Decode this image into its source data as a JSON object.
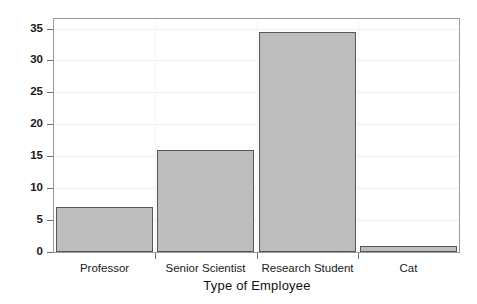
{
  "chart_data": {
    "type": "bar",
    "title": "",
    "xlabel": "Type of Employee",
    "ylabel": "Frequency",
    "categories": [
      "Professor",
      "Senior Scientist",
      "Research Student",
      "Cat"
    ],
    "values": [
      7,
      16,
      34.5,
      1
    ],
    "series": [
      {
        "name": "Frequency",
        "values": [
          7,
          16,
          34.5,
          1
        ]
      }
    ],
    "ylim": [
      0,
      36.5
    ],
    "yticks": [
      0,
      5,
      10,
      15,
      20,
      25,
      30,
      35
    ],
    "ytick_labels": [
      "0",
      "5",
      "10",
      "15",
      "20",
      "25",
      "30",
      "35"
    ],
    "xtick_labels": [
      "Professor",
      "Senior Scientist",
      "Research Student",
      "Cat"
    ],
    "grid": true,
    "legend": false,
    "legend_position": "none",
    "bar_fill_color": "#bdbdbd",
    "bar_edge_color": "#565656",
    "frame_color": "#9a9a9a",
    "gridline_color": "#f0f0f0",
    "background_color": "#ffffff"
  }
}
